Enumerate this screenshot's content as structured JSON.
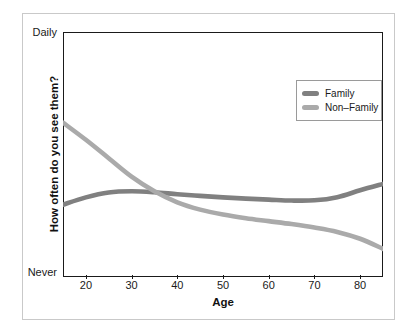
{
  "chart_data": {
    "type": "line",
    "title": "",
    "xlabel": "Age",
    "ylabel": "How often do you see them?",
    "xlim": [
      15,
      85
    ],
    "ylim": [
      0,
      100
    ],
    "xticks": [
      20,
      30,
      40,
      50,
      60,
      70,
      80
    ],
    "yticks": [
      "Never",
      "Daily"
    ],
    "ytick_labels": {
      "top": "Daily",
      "bottom": "Never"
    },
    "grid": false,
    "legend_position": "top-right",
    "series": [
      {
        "name": "Family",
        "color": "#808080",
        "x": [
          15,
          20,
          25,
          30,
          35,
          40,
          45,
          50,
          55,
          60,
          65,
          70,
          75,
          80,
          85
        ],
        "values": [
          29.5,
          32.5,
          34.5,
          35.0,
          34.6,
          33.8,
          33.1,
          32.5,
          32.0,
          31.6,
          31.2,
          31.3,
          32.6,
          35.4,
          38.0
        ]
      },
      {
        "name": "Non-Family",
        "color": "#aaaaaa",
        "x": [
          15,
          20,
          25,
          30,
          35,
          40,
          45,
          50,
          55,
          60,
          65,
          70,
          75,
          80,
          85
        ],
        "values": [
          63.0,
          56.0,
          48.5,
          41.0,
          35.0,
          30.5,
          27.5,
          25.5,
          24.0,
          22.8,
          21.6,
          20.2,
          18.4,
          15.6,
          11.5
        ]
      }
    ],
    "annotations": []
  },
  "legend": {
    "items": [
      {
        "label": "Family",
        "color": "#808080"
      },
      {
        "label": "Non–Family",
        "color": "#aaaaaa"
      }
    ]
  },
  "axes": {
    "x_title": "Age",
    "y_title": "How often do you see them?",
    "y_top_label": "Daily",
    "y_bottom_label": "Never",
    "x_tick_labels": [
      "20",
      "30",
      "40",
      "50",
      "60",
      "70",
      "80"
    ]
  },
  "colors": {
    "family": "#808080",
    "non_family": "#aaaaaa",
    "panel_border": "#1a1a1a",
    "outer_frame": "#c9c9c9",
    "background": "#ffffff"
  }
}
